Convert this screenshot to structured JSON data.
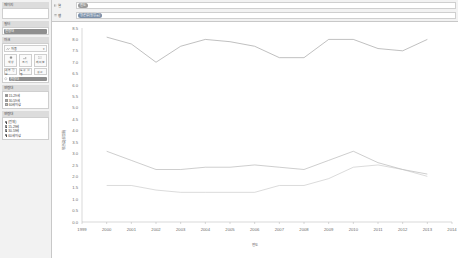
{
  "sidebar": {
    "pages": {
      "title": "페이지",
      "value": ""
    },
    "filters": {
      "title": "필터",
      "pill": "연령대"
    },
    "marks": {
      "title": "마크",
      "mark_type": "자동",
      "mark_type_caret": "▾",
      "buttons": [
        {
          "name": "color",
          "label": "색상",
          "icon": "color-icon"
        },
        {
          "name": "size",
          "label": "크기",
          "icon": "size-icon"
        },
        {
          "name": "label",
          "label": "레이블",
          "icon": "label-icon"
        },
        {
          "name": "detail",
          "label": "세부 정보",
          "icon": "detail-icon"
        },
        {
          "name": "tooltip",
          "label": "도구 설명",
          "icon": "tooltip-icon"
        },
        {
          "name": "path",
          "label": "경로",
          "icon": "path-icon"
        }
      ],
      "pill": "연령대"
    },
    "legend": {
      "title": "연령대",
      "items": [
        {
          "label": "15-29세",
          "color": "#8c8c8c"
        },
        {
          "label": "30-59세",
          "color": "#a5a5a5"
        },
        {
          "label": "60세이상",
          "color": "#bdbdbd"
        }
      ]
    },
    "filter_card": {
      "title": "연령대",
      "items": [
        {
          "label": "(전체)",
          "checked": true
        },
        {
          "label": "15-29세",
          "checked": true
        },
        {
          "label": "30-59세",
          "checked": true
        },
        {
          "label": "60세이상",
          "checked": true
        }
      ]
    }
  },
  "shelves": {
    "columns": {
      "label": "열",
      "icon": "columns-icon",
      "pill": "연도"
    },
    "rows": {
      "label": "행",
      "icon": "rows-icon",
      "pill": "평균값(실업률)"
    }
  },
  "chart_data": {
    "type": "line",
    "title": "",
    "xlabel": "연도",
    "ylabel": "평균값(실업률)",
    "x": [
      1999,
      2000,
      2001,
      2002,
      2003,
      2004,
      2005,
      2006,
      2007,
      2008,
      2009,
      2010,
      2011,
      2012,
      2013,
      2014
    ],
    "xticklabels": [
      "1999",
      "2000",
      "2001",
      "2002",
      "2003",
      "2004",
      "2005",
      "2006",
      "2007",
      "2008",
      "2009",
      "2010",
      "2011",
      "2012",
      "2013",
      "2014"
    ],
    "ylim": [
      0.0,
      8.5
    ],
    "yticks": [
      0.0,
      0.5,
      1.0,
      1.5,
      2.0,
      2.5,
      3.0,
      3.5,
      4.0,
      4.5,
      5.0,
      5.5,
      6.0,
      6.5,
      7.0,
      7.5,
      8.0,
      8.5
    ],
    "grid": false,
    "legend_position": "sidebar",
    "series": [
      {
        "name": "15-29세",
        "color": "#8c8c8c",
        "x": [
          2000,
          2001,
          2002,
          2003,
          2004,
          2005,
          2006,
          2007,
          2008,
          2009,
          2010,
          2011,
          2012,
          2013
        ],
        "values": [
          8.1,
          7.8,
          7.0,
          7.7,
          8.0,
          7.9,
          7.7,
          7.2,
          7.2,
          8.0,
          8.0,
          7.6,
          7.5,
          8.0
        ]
      },
      {
        "name": "30-59세",
        "color": "#a5a5a5",
        "x": [
          2000,
          2001,
          2002,
          2003,
          2004,
          2005,
          2006,
          2007,
          2008,
          2009,
          2010,
          2011,
          2012,
          2013
        ],
        "values": [
          3.1,
          2.7,
          2.3,
          2.3,
          2.4,
          2.4,
          2.5,
          2.4,
          2.3,
          2.7,
          3.1,
          2.6,
          2.3,
          2.1
        ]
      },
      {
        "name": "60세이상",
        "color": "#bdbdbd",
        "x": [
          2000,
          2001,
          2002,
          2003,
          2004,
          2005,
          2006,
          2007,
          2008,
          2009,
          2010,
          2011,
          2012,
          2013
        ],
        "values": [
          1.6,
          1.6,
          1.4,
          1.3,
          1.3,
          1.3,
          1.3,
          1.6,
          1.6,
          1.9,
          2.4,
          2.5,
          2.3,
          2.0
        ]
      }
    ]
  }
}
